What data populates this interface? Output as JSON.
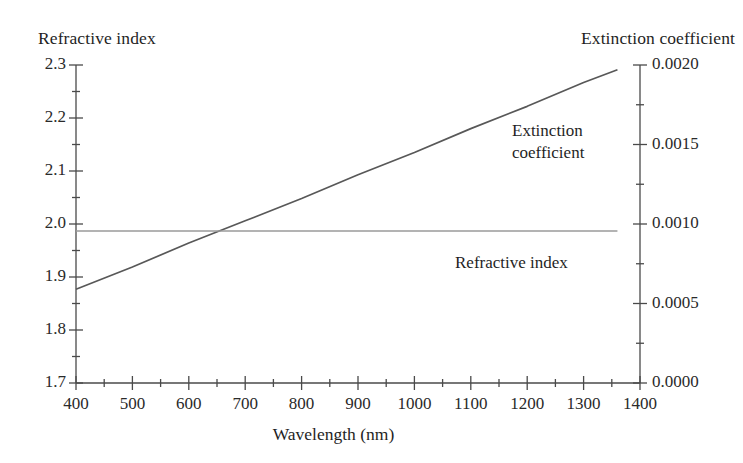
{
  "figure": {
    "left_axis_title": "Refractive index",
    "right_axis_title": "Extinction coefficient",
    "x_axis_title": "Wavelength (nm)",
    "annotations": {
      "extinction_line1": "Extinction",
      "extinction_line2": "coefficient",
      "refractive": "Refractive index"
    },
    "colors": {
      "axis": "#4a4a4a",
      "extinction_curve": "#585858",
      "refractive_curve": "#9a9a9a",
      "text": "#1f1f1f",
      "background": "#ffffff"
    }
  },
  "chart_data": {
    "type": "line",
    "title": "",
    "subtitle": "",
    "xlabel": "Wavelength (nm)",
    "ylabel": "Refractive index",
    "y2label": "Extinction coefficient",
    "xlim": [
      400,
      1400
    ],
    "ylim": [
      1.7,
      2.3
    ],
    "y2lim": [
      0.0,
      0.002
    ],
    "grid": false,
    "legend": "inline-annotations",
    "xticks": [
      400,
      500,
      600,
      700,
      800,
      900,
      1000,
      1100,
      1200,
      1300,
      1400
    ],
    "xticklabels": [
      "400",
      "500",
      "600",
      "700",
      "800",
      "900",
      "1000",
      "1100",
      "1200",
      "1300",
      "1400"
    ],
    "x_minor_tick_step": 50,
    "yticks": [
      1.7,
      1.8,
      1.9,
      2.0,
      2.1,
      2.2,
      2.3
    ],
    "yticklabels": [
      "1.7",
      "1.8",
      "1.9",
      "2.0",
      "2.1",
      "2.2",
      "2.3"
    ],
    "y_minor_tick_step": 0.05,
    "y2ticks": [
      0.0,
      0.0005,
      0.001,
      0.0015,
      0.002
    ],
    "y2ticklabels": [
      "0.0000",
      "0.0005",
      "0.0010",
      "0.0015",
      "0.0020"
    ],
    "y2_minor_tick_step": 0.00025,
    "series": [
      {
        "name": "Extinction coefficient",
        "axis": "y2",
        "x": [
          400,
          500,
          600,
          700,
          800,
          900,
          1000,
          1100,
          1200,
          1300,
          1360
        ],
        "values": [
          0.00059,
          0.00073,
          0.00088,
          0.00102,
          0.00116,
          0.00131,
          0.00145,
          0.0016,
          0.00174,
          0.00189,
          0.00197
        ],
        "color": "#585858"
      },
      {
        "name": "Refractive index",
        "axis": "y",
        "x": [
          400,
          500,
          600,
          700,
          800,
          900,
          1000,
          1100,
          1200,
          1300,
          1360
        ],
        "values": [
          1.987,
          1.987,
          1.987,
          1.987,
          1.987,
          1.987,
          1.987,
          1.987,
          1.987,
          1.987,
          1.987
        ],
        "color": "#9a9a9a"
      }
    ],
    "crossing_point": {
      "x": 625,
      "y": 1.987
    }
  }
}
